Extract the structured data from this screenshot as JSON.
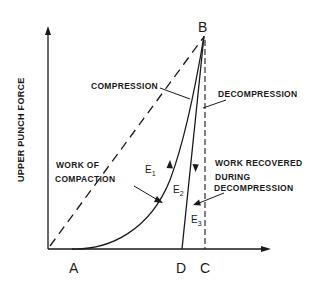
{
  "diagram": {
    "y_axis_label": "UPPER PUNCH FORCE",
    "points": {
      "A": "A",
      "B": "B",
      "C": "C",
      "D": "D"
    },
    "labels": {
      "compression": "COMPRESSION",
      "decompression": "DECOMPRESSION",
      "work_of_compaction_line1": "WORK OF",
      "work_of_compaction_line2": "COMPACTION",
      "work_recovered_line1": "WORK RECOVERED",
      "work_recovered_line2": "DURING",
      "work_recovered_line3": "DECOMPRESSION"
    },
    "regions": {
      "E1": {
        "base": "E",
        "sub": "1"
      },
      "E2": {
        "base": "E",
        "sub": "2"
      },
      "E3": {
        "base": "E",
        "sub": "3"
      }
    },
    "colors": {
      "ink": "#1a1a1a",
      "background": "#ffffff"
    }
  }
}
